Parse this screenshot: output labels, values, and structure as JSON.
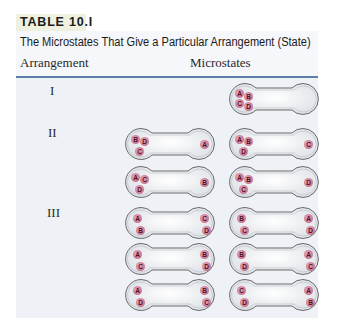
{
  "table": {
    "label": "TABLE 10.I",
    "caption": "The Microstates That Give a Particular Arrangement (State)",
    "columns": [
      "Arrangement",
      "Microstates"
    ],
    "colors": {
      "rule": "#5b7fa8",
      "body_bg": "#eef2f7",
      "ball": "#c7738f"
    },
    "rows": [
      {
        "arrangement": "I",
        "microstates": [
          {
            "left": [
              "A",
              "B",
              "C",
              "D"
            ],
            "right": []
          }
        ]
      },
      {
        "arrangement": "II",
        "microstates": [
          {
            "left": [
              "B",
              "D",
              "C"
            ],
            "right": [
              "A"
            ]
          },
          {
            "left": [
              "A",
              "B",
              "D"
            ],
            "right": [
              "C"
            ]
          },
          {
            "left": [
              "A",
              "C",
              "D"
            ],
            "right": [
              "B"
            ]
          },
          {
            "left": [
              "A",
              "B",
              "C"
            ],
            "right": [
              "D"
            ]
          }
        ]
      },
      {
        "arrangement": "III",
        "microstates": [
          {
            "left": [
              "A",
              "B"
            ],
            "right": [
              "C",
              "D"
            ]
          },
          {
            "left": [
              "B",
              "C"
            ],
            "right": [
              "A",
              "D"
            ]
          },
          {
            "left": [
              "A",
              "C"
            ],
            "right": [
              "B",
              "D"
            ]
          },
          {
            "left": [
              "B",
              "D"
            ],
            "right": [
              "A",
              "C"
            ]
          },
          {
            "left": [
              "A",
              "D"
            ],
            "right": [
              "B",
              "C"
            ]
          },
          {
            "left": [
              "C",
              "D"
            ],
            "right": [
              "A",
              "B"
            ]
          }
        ]
      }
    ]
  }
}
